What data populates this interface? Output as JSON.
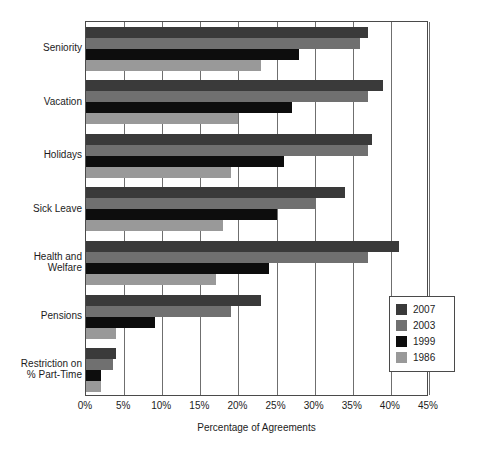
{
  "chart_data": {
    "type": "bar",
    "orientation": "horizontal",
    "title": "",
    "xlabel": "Percentage of Agreements",
    "ylabel": "",
    "xlim": [
      0,
      45
    ],
    "xticks": [
      "0%",
      "5%",
      "10%",
      "15%",
      "20%",
      "25%",
      "30%",
      "35%",
      "40%",
      "45%"
    ],
    "xtick_values": [
      0,
      5,
      10,
      15,
      20,
      25,
      30,
      35,
      40,
      45
    ],
    "grid": true,
    "grid_axis": "x",
    "legend_position": "lower-right",
    "categories": [
      "Seniority",
      "Vacation",
      "Holidays",
      "Sick Leave",
      "Health and Welfare",
      "Pensions",
      "Restriction on % Part-Time"
    ],
    "series": [
      {
        "name": "2007",
        "color": "#3a3a3a",
        "values": [
          37.0,
          39.0,
          37.5,
          34.0,
          41.0,
          23.0,
          4.0
        ]
      },
      {
        "name": "2003",
        "color": "#707070",
        "values": [
          36.0,
          37.0,
          37.0,
          30.0,
          37.0,
          19.0,
          3.5
        ]
      },
      {
        "name": "1999",
        "color": "#0d0d0d",
        "values": [
          28.0,
          27.0,
          26.0,
          25.0,
          24.0,
          9.0,
          2.0
        ]
      },
      {
        "name": "1986",
        "color": "#999999",
        "values": [
          23.0,
          20.0,
          19.0,
          18.0,
          17.0,
          4.0,
          2.0
        ]
      }
    ]
  },
  "axis": {
    "x_title": "Percentage of Agreements"
  },
  "category_labels": [
    {
      "line1": "Seniority",
      "line2": ""
    },
    {
      "line1": "Vacation",
      "line2": ""
    },
    {
      "line1": "Holidays",
      "line2": ""
    },
    {
      "line1": "Sick Leave",
      "line2": ""
    },
    {
      "line1": "Health and",
      "line2": "Welfare"
    },
    {
      "line1": "Pensions",
      "line2": ""
    },
    {
      "line1": "Restriction on",
      "line2": "% Part-Time"
    }
  ],
  "legend": {
    "items": [
      {
        "label": "2007",
        "color": "#3a3a3a"
      },
      {
        "label": "2003",
        "color": "#707070"
      },
      {
        "label": "1999",
        "color": "#0d0d0d"
      },
      {
        "label": "1986",
        "color": "#999999"
      }
    ]
  },
  "style": {
    "plot_border_color": "#4a4a4a",
    "gridline_color": "#6f6f6f",
    "background": "#ffffff",
    "text_color": "#1c1c1c"
  }
}
